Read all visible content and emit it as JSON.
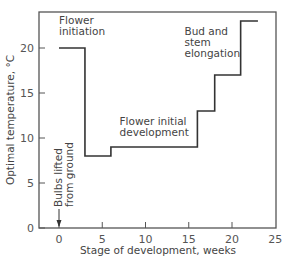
{
  "chart_data": {
    "type": "line",
    "step": true,
    "title": "",
    "xlabel": "Stage of development, weeks",
    "ylabel": "Optimal temperature, °C",
    "xlim": [
      -4.5,
      25
    ],
    "ylim": [
      0,
      24.5
    ],
    "xticks": [
      0,
      5,
      10,
      15,
      20,
      25
    ],
    "yticks": [
      0,
      5,
      10,
      15,
      20
    ],
    "grid": false,
    "series": [
      {
        "name": "Optimal temperature",
        "points": [
          [
            0,
            20
          ],
          [
            3,
            20
          ],
          [
            3,
            8
          ],
          [
            6,
            8
          ],
          [
            6,
            9
          ],
          [
            16,
            9
          ],
          [
            16,
            13
          ],
          [
            18,
            13
          ],
          [
            18,
            17
          ],
          [
            21,
            17
          ],
          [
            21,
            23
          ],
          [
            23,
            23
          ]
        ]
      }
    ],
    "annotations": [
      {
        "text_lines": [
          "Flower",
          "initiation"
        ],
        "x": 0,
        "y": 21.5
      },
      {
        "text_lines": [
          "Flower initial",
          "development"
        ],
        "x": 7,
        "y": 10.2
      },
      {
        "text_lines": [
          "Bud and",
          "stem",
          "elongation"
        ],
        "x": 14.5,
        "y": 19
      },
      {
        "text_lines": [
          "Bulbs lifted",
          "from ground"
        ],
        "x": 0,
        "y": 1,
        "rotated": true,
        "arrow": "down"
      }
    ]
  }
}
